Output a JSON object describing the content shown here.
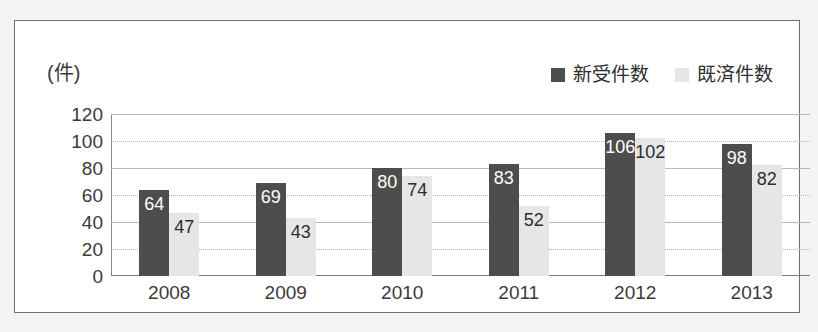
{
  "chart_data": {
    "type": "bar",
    "title": "",
    "subtitle": "",
    "xlabel": "",
    "ylabel": "(件)",
    "unit_label": "(件)",
    "categories": [
      "2008",
      "2009",
      "2010",
      "2011",
      "2012",
      "2013"
    ],
    "series": [
      {
        "name": "新受件数",
        "color": "#4d4d4d",
        "values": [
          64,
          69,
          80,
          83,
          106,
          98
        ]
      },
      {
        "name": "既済件数",
        "color": "#e6e6e6",
        "values": [
          47,
          43,
          74,
          52,
          102,
          82
        ]
      }
    ],
    "ylim": [
      0,
      120
    ],
    "yticks": [
      "120",
      "100",
      "80",
      "60",
      "40",
      "20",
      "0"
    ],
    "ytick_values": [
      120,
      100,
      80,
      60,
      40,
      20,
      0
    ],
    "grid": true,
    "grid_style": [
      "solid",
      "dotted",
      "solid",
      "dotted",
      "solid",
      "dotted",
      "solid"
    ],
    "legend_position": "top-right",
    "data_labels": true
  },
  "legend": {
    "entries": [
      {
        "label": "新受件数",
        "color": "#4d4d4d"
      },
      {
        "label": "既済件数",
        "color": "#e6e6e6"
      }
    ]
  },
  "colors": {
    "series_dark": "#4d4d4d",
    "series_light": "#e6e6e6",
    "frame_border": "#6e6e6e",
    "grid": "#b9b9b9",
    "text": "#3a3a3a",
    "page_background": "#f4f4f4",
    "plot_background": "#ffffff"
  }
}
